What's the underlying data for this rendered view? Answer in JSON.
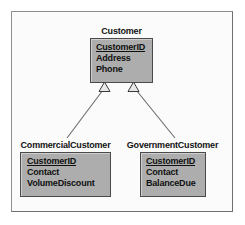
{
  "diagram": {
    "type": "uml-class-diagram",
    "notation": "generalization",
    "frame_border_color": "#8e8e8e",
    "node_fill_color": "#adadad",
    "node_border_color": "#4a4a4a",
    "background_color": "#fbfbfb",
    "classes": [
      {
        "id": "customer",
        "name": "Customer",
        "role": "superclass",
        "attributes": [
          {
            "name": "CustomerID",
            "primary_key": true
          },
          {
            "name": "Address",
            "primary_key": false
          },
          {
            "name": "Phone",
            "primary_key": false
          }
        ]
      },
      {
        "id": "commercial",
        "name": "CommercialCustomer",
        "role": "subclass",
        "attributes": [
          {
            "name": "CustomerID",
            "primary_key": true
          },
          {
            "name": "Contact",
            "primary_key": false
          },
          {
            "name": "VolumeDiscount",
            "primary_key": false
          }
        ]
      },
      {
        "id": "government",
        "name": "GovernmentCustomer",
        "role": "subclass",
        "attributes": [
          {
            "name": "CustomerID",
            "primary_key": true
          },
          {
            "name": "Contact",
            "primary_key": false
          },
          {
            "name": "BalanceDue",
            "primary_key": false
          }
        ]
      }
    ],
    "relationships": [
      {
        "from": "commercial",
        "to": "customer",
        "kind": "generalization",
        "arrowhead": "hollow-triangle"
      },
      {
        "from": "government",
        "to": "customer",
        "kind": "generalization",
        "arrowhead": "hollow-triangle"
      }
    ]
  }
}
